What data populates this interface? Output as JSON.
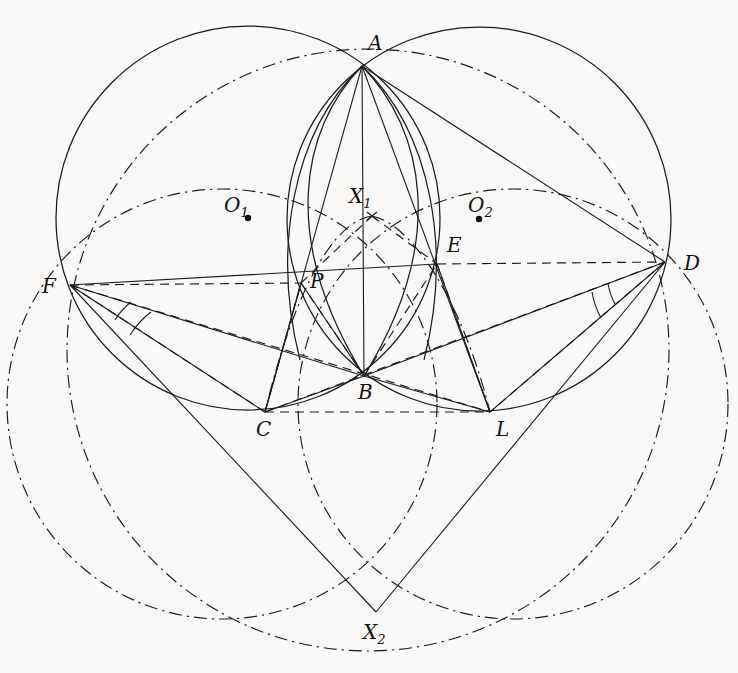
{
  "figure": {
    "kind": "euclidean-geometry-diagram",
    "title": "",
    "background_color": "#faf9f7",
    "ink_color": "#1b1b1b",
    "width": 738,
    "height": 673
  },
  "points": [
    {
      "id": "A",
      "label": "A",
      "x": 362,
      "y": 66,
      "label_x": 368,
      "label_y": 50,
      "has_dot": false
    },
    {
      "id": "O1",
      "label": "O",
      "sub": "1",
      "x": 248,
      "y": 218,
      "label_x": 224,
      "label_y": 212,
      "has_dot": true
    },
    {
      "id": "X1",
      "label": "X",
      "sub": "1",
      "x": 372,
      "y": 216,
      "label_x": 352,
      "label_y": 203,
      "has_dot": false
    },
    {
      "id": "O2",
      "label": "O",
      "sub": "2",
      "x": 479,
      "y": 219,
      "label_x": 471,
      "label_y": 212,
      "has_dot": true
    },
    {
      "id": "E",
      "label": "E",
      "x": 437,
      "y": 264,
      "label_x": 447,
      "label_y": 251,
      "has_dot": false
    },
    {
      "id": "D",
      "label": "D",
      "x": 665,
      "y": 262,
      "label_x": 685,
      "label_y": 270,
      "has_dot": false
    },
    {
      "id": "F",
      "label": "F",
      "x": 70,
      "y": 285,
      "label_x": 44,
      "label_y": 292,
      "has_dot": false
    },
    {
      "id": "P",
      "label": "P",
      "x": 301,
      "y": 283,
      "label_x": 310,
      "label_y": 287,
      "has_dot": false
    },
    {
      "id": "B",
      "label": "B",
      "x": 364,
      "y": 376,
      "label_x": 366,
      "label_y": 398,
      "has_dot": false
    },
    {
      "id": "C",
      "label": "C",
      "x": 265,
      "y": 412,
      "label_x": 258,
      "label_y": 435,
      "has_dot": false
    },
    {
      "id": "L",
      "label": "L",
      "x": 490,
      "y": 412,
      "label_x": 498,
      "label_y": 435,
      "has_dot": false
    },
    {
      "id": "X2",
      "label": "X",
      "sub": "2",
      "x": 376,
      "y": 612,
      "label_x": 365,
      "label_y": 638,
      "has_dot": false
    }
  ],
  "circles": [
    {
      "id": "circle-O1",
      "name": "circumcircle-AFC",
      "cx": 248,
      "cy": 218,
      "r": 192,
      "style": "solid"
    },
    {
      "id": "circle-O2",
      "name": "circumcircle-ADL",
      "cx": 479,
      "cy": 219,
      "r": 192,
      "style": "solid"
    },
    {
      "id": "circle-upper-dashdot",
      "name": "circle-through-F-X1-D",
      "cx": 368,
      "cy": 345,
      "r": 300,
      "style": "dashdot"
    },
    {
      "id": "circle-left-dashdot",
      "name": "circle-through-F-C-X2",
      "cx": 222,
      "cy": 404,
      "r": 220,
      "style": "dashdot"
    },
    {
      "id": "circle-right-dashdot",
      "name": "circle-through-D-L-X2",
      "cx": 513,
      "cy": 404,
      "r": 220,
      "style": "dashdot"
    }
  ],
  "arcs": [
    {
      "id": "arc-A-P-C-B",
      "name": "arc-APB-left-lens",
      "style": "solid"
    },
    {
      "id": "arc-A-E-B",
      "name": "arc-AEB-right-lens",
      "style": "solid"
    },
    {
      "id": "arc-X1-P-C",
      "name": "dashdot-arc-X1-P-C",
      "style": "dashdot"
    },
    {
      "id": "arc-X1-E-L",
      "name": "dashdot-arc-X1-E-L",
      "style": "dashdot"
    }
  ],
  "segments_solid": [
    {
      "from": "A",
      "to": "C"
    },
    {
      "from": "A",
      "to": "B"
    },
    {
      "from": "A",
      "to": "L"
    },
    {
      "from": "A",
      "to": "D"
    },
    {
      "from": "F",
      "to": "B"
    },
    {
      "from": "F",
      "to": "C"
    },
    {
      "from": "F",
      "to": "X2"
    },
    {
      "from": "D",
      "to": "B"
    },
    {
      "from": "D",
      "to": "L"
    },
    {
      "from": "D",
      "to": "X2"
    },
    {
      "from": "C",
      "to": "B"
    },
    {
      "from": "B",
      "to": "L"
    },
    {
      "from": "P",
      "to": "C"
    },
    {
      "from": "E",
      "to": "L"
    },
    {
      "from": "F",
      "to": "E"
    }
  ],
  "segments_dashed": [
    {
      "from": "F",
      "to": "P"
    },
    {
      "from": "P",
      "to": "E"
    },
    {
      "from": "E",
      "to": "D"
    },
    {
      "from": "C",
      "to": "L"
    },
    {
      "from": "F",
      "to": "L"
    },
    {
      "from": "C",
      "to": "D"
    },
    {
      "from": "P",
      "to": "X1"
    },
    {
      "from": "X1",
      "to": "E"
    },
    {
      "from": "P",
      "to": "B"
    },
    {
      "from": "B",
      "to": "E"
    },
    {
      "from": "C",
      "to": "P"
    },
    {
      "from": "L",
      "to": "E"
    },
    {
      "from": "F",
      "to": "C"
    },
    {
      "from": "D",
      "to": "L"
    }
  ],
  "angle_marks": [
    {
      "at": "F",
      "name": "angle-mark-at-F",
      "count": 2
    },
    {
      "at": "D",
      "name": "angle-mark-at-D",
      "count": 2
    }
  ],
  "legend": {
    "solid": "solid line",
    "dashed": "dashed line",
    "dashdot": "dash-dot line"
  }
}
